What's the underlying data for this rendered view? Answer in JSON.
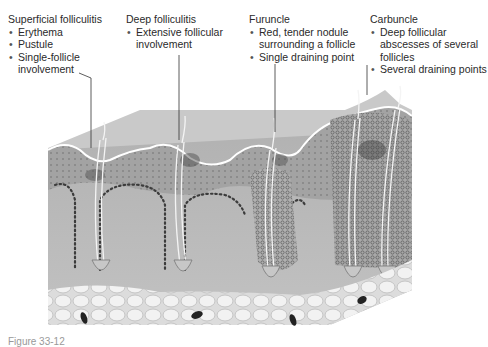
{
  "figure": {
    "type": "skin cross-section illustration"
  },
  "labels": [
    {
      "title": "Superficial folliculitis",
      "bullets": [
        "Erythema",
        "Pustule",
        "Single-follicle involvement"
      ]
    },
    {
      "title": "Deep folliculitis",
      "bullets": [
        "Extensive follicular involvement"
      ]
    },
    {
      "title": "Furuncle",
      "bullets": [
        "Red, tender nodule surrounding a follicle",
        "Single draining point"
      ]
    },
    {
      "title": "Carbuncle",
      "bullets": [
        "Deep follicular abscesses of several follicles",
        "Several draining points"
      ]
    }
  ],
  "caption": "Figure 33-12",
  "colors": {
    "epidermis": "#a9a9a9",
    "dermis": "#bdbdbd",
    "top_surface": "#c8c8c8",
    "fat": "#e6e6e6",
    "dots": "#3c3c3c",
    "surface_line": "#ffffff"
  }
}
